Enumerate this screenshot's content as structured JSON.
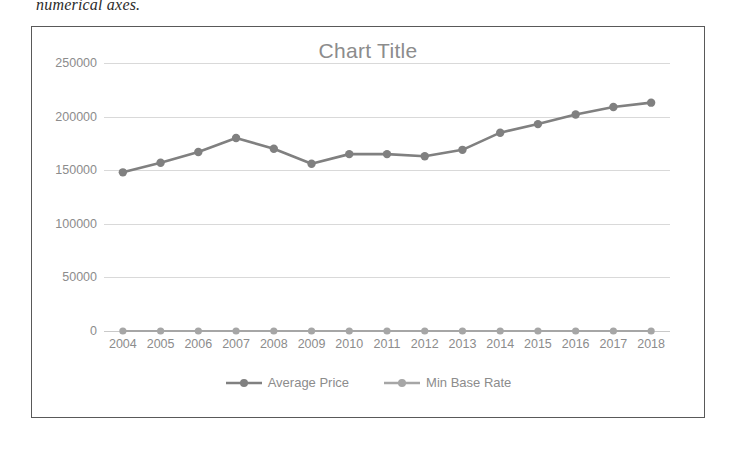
{
  "document": {
    "text_above_figure": "numerical axes."
  },
  "chart": {
    "title": "Chart Title",
    "frame_border_color": "#595959",
    "plot_background": "#ffffff",
    "gridline_color": "#d9d9d9",
    "text_color": "#8c8c8c"
  },
  "chart_data": {
    "type": "line",
    "title": "Chart Title",
    "xlabel": "",
    "ylabel": "",
    "categories": [
      "2004",
      "2005",
      "2006",
      "2007",
      "2008",
      "2009",
      "2010",
      "2011",
      "2012",
      "2013",
      "2014",
      "2015",
      "2016",
      "2017",
      "2018"
    ],
    "ylim": [
      0,
      250000
    ],
    "yticks": [
      0,
      50000,
      100000,
      150000,
      200000,
      250000
    ],
    "ytick_labels": [
      "0",
      "50000",
      "100000",
      "150000",
      "200000",
      "250000"
    ],
    "grid": true,
    "legend_position": "bottom",
    "series": [
      {
        "name": "Average Price",
        "color": "#808080",
        "marker": "circle",
        "values": [
          148000,
          157000,
          167000,
          180000,
          170000,
          156000,
          165000,
          165000,
          163000,
          169000,
          185000,
          193000,
          202000,
          209000,
          213000
        ]
      },
      {
        "name": "Min Base Rate",
        "color": "#a6a6a6",
        "marker": "circle",
        "values": [
          0,
          0,
          0,
          0,
          0,
          0,
          0,
          0,
          0,
          0,
          0,
          0,
          0,
          0,
          0
        ]
      }
    ]
  }
}
